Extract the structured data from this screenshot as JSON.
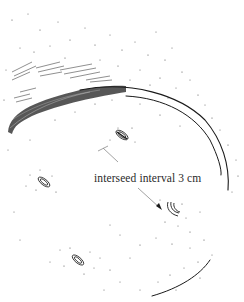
{
  "figure": {
    "type": "hand-drawn illustration",
    "annotation": {
      "label": "interseed interval 3 cm"
    },
    "seeds": [
      {
        "id": "seed-upper-center",
        "x": 123,
        "y": 135,
        "shape": "oval"
      },
      {
        "id": "seed-left",
        "x": 44,
        "y": 182,
        "shape": "oval"
      },
      {
        "id": "seed-right",
        "x": 172,
        "y": 210,
        "shape": "curved"
      },
      {
        "id": "seed-lower",
        "x": 78,
        "y": 260,
        "shape": "oval"
      }
    ],
    "colors": {
      "ink": "#1a1a1a",
      "annotation_line": "#8a8a8a",
      "background": "#ffffff"
    }
  }
}
